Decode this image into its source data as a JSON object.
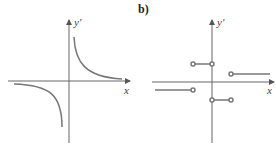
{
  "panels": [
    {
      "id": "a",
      "label": "",
      "x_axis_label": "x",
      "y_axis_label": "y'",
      "curve": "hyperbola y'=k/x"
    },
    {
      "id": "b",
      "label": "b)",
      "x_axis_label": "x",
      "y_axis_label": "y'",
      "curve": "step function with open endpoints"
    }
  ],
  "colors": {
    "axis": "#666666",
    "curve": "#777777"
  }
}
